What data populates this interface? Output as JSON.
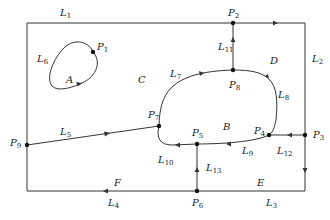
{
  "diagram": {
    "type": "planar-graph-regions",
    "colors": {
      "stroke": "#333333",
      "background": "#ffffff"
    },
    "points": [
      {
        "id": "P1",
        "label": "P",
        "sub": "1",
        "x": 93,
        "y": 52,
        "lx": 97,
        "ly": 50
      },
      {
        "id": "P2",
        "label": "P",
        "sub": "2",
        "x": 233,
        "y": 23,
        "lx": 228,
        "ly": 16
      },
      {
        "id": "P3",
        "label": "P",
        "sub": "3",
        "x": 305,
        "y": 135,
        "lx": 313,
        "ly": 138
      },
      {
        "id": "P4",
        "label": "P",
        "sub": "4",
        "x": 269,
        "y": 135,
        "lx": 254,
        "ly": 134
      },
      {
        "id": "P5",
        "label": "P",
        "sub": "5",
        "x": 197,
        "y": 144,
        "lx": 192,
        "ly": 136
      },
      {
        "id": "P6",
        "label": "P",
        "sub": "6",
        "x": 197,
        "y": 191,
        "lx": 192,
        "ly": 206
      },
      {
        "id": "P7",
        "label": "P",
        "sub": "7",
        "x": 159,
        "y": 126,
        "lx": 148,
        "ly": 118
      },
      {
        "id": "P8",
        "label": "P",
        "sub": "8",
        "x": 233,
        "y": 70,
        "lx": 229,
        "ly": 88
      },
      {
        "id": "P9",
        "label": "P",
        "sub": "9",
        "x": 27,
        "y": 145,
        "lx": 10,
        "ly": 146
      }
    ],
    "edges": [
      {
        "id": "L1",
        "label": "L",
        "sub": "1",
        "lx": 60,
        "ly": 16
      },
      {
        "id": "L2",
        "label": "L",
        "sub": "2",
        "lx": 312,
        "ly": 62
      },
      {
        "id": "L3",
        "label": "L",
        "sub": "3",
        "lx": 266,
        "ly": 206
      },
      {
        "id": "L4",
        "label": "L",
        "sub": "4",
        "lx": 108,
        "ly": 206
      },
      {
        "id": "L5",
        "label": "L",
        "sub": "5",
        "lx": 60,
        "ly": 135
      },
      {
        "id": "L6",
        "label": "L",
        "sub": "6",
        "lx": 37,
        "ly": 62
      },
      {
        "id": "L7",
        "label": "L",
        "sub": "7",
        "lx": 170,
        "ly": 77
      },
      {
        "id": "L8",
        "label": "L",
        "sub": "8",
        "lx": 278,
        "ly": 98
      },
      {
        "id": "L9",
        "label": "L",
        "sub": "9",
        "lx": 242,
        "ly": 154
      },
      {
        "id": "L10",
        "label": "L",
        "sub": "10",
        "lx": 158,
        "ly": 163
      },
      {
        "id": "L11",
        "label": "L",
        "sub": "11",
        "lx": 218,
        "ly": 50
      },
      {
        "id": "L12",
        "label": "L",
        "sub": "12",
        "lx": 277,
        "ly": 154
      },
      {
        "id": "L13",
        "label": "L",
        "sub": "13",
        "lx": 206,
        "ly": 171
      }
    ],
    "regions": [
      {
        "id": "A",
        "label": "A",
        "lx": 66,
        "ly": 83
      },
      {
        "id": "B",
        "label": "B",
        "lx": 223,
        "ly": 130
      },
      {
        "id": "C",
        "label": "C",
        "lx": 138,
        "ly": 83
      },
      {
        "id": "D",
        "label": "D",
        "lx": 270,
        "ly": 64
      },
      {
        "id": "E",
        "label": "E",
        "lx": 257,
        "ly": 186
      },
      {
        "id": "F",
        "label": "F",
        "lx": 114,
        "ly": 186
      }
    ]
  }
}
